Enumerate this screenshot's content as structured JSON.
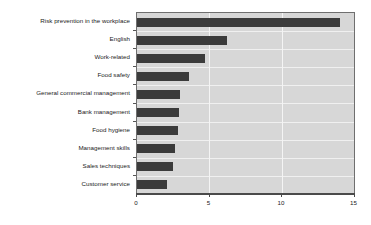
{
  "chart_data": {
    "type": "bar",
    "orientation": "horizontal",
    "title": "",
    "subtitle": "",
    "xlabel": "",
    "ylabel": "",
    "xlim": [
      0,
      15
    ],
    "ylim": null,
    "grid": true,
    "legend": null,
    "legend_position": "none",
    "xticks": [
      "0",
      "5",
      "10",
      "15"
    ],
    "xtick_values": [
      0,
      5,
      10,
      15
    ],
    "categories": [
      "Risk prevention in the workplace",
      "English",
      "Work-related",
      "Food safety",
      "General commercial management",
      "Bank management",
      "Food hygiene",
      "Management skills",
      "Sales techniques",
      "Customer service"
    ],
    "values": [
      14.0,
      6.2,
      4.7,
      3.6,
      3.0,
      2.9,
      2.8,
      2.6,
      2.5,
      2.1
    ],
    "colors": {
      "bar": "#3b3b3b",
      "plot_background": "#d7d7d7",
      "gridline": "#f4f4f4",
      "axis": "#4a4a4a",
      "plot_border": "#6f6f6f",
      "text": "#1a1a1a",
      "page_background": "#ffffff"
    }
  }
}
